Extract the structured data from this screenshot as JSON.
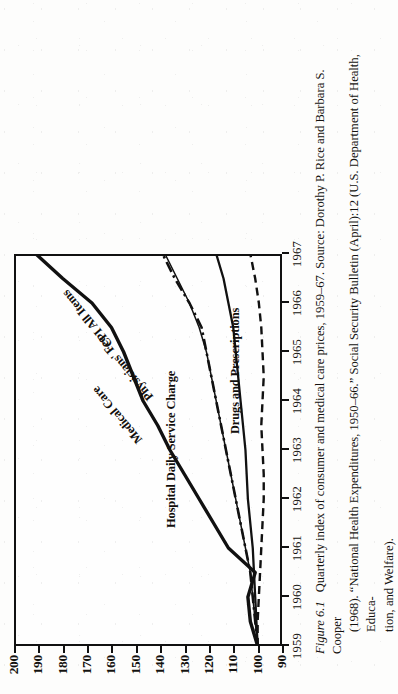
{
  "figure": {
    "number_label": "Figure 6.1",
    "caption_line1": "Quarterly index of consumer and medical care prices, 1959–67. Source: Dorothy P. Rice and Barbara S. Cooper",
    "caption_line2": "(1968). “National Health Expenditures, 1950–66.” Social Security Bulletin (April):12 (U.S. Department of Health, Educa-",
    "caption_line3": "tion, and Welfare).",
    "orientation": "rotated-90-ccw",
    "ink_color": "#111111",
    "paper_color": "#fdfdfc"
  },
  "axes": {
    "y_ticks": [
      "200",
      "190",
      "180",
      "170",
      "160",
      "150",
      "140",
      "130",
      "120",
      "110",
      "100",
      "90"
    ],
    "y_values": [
      200,
      190,
      180,
      170,
      160,
      150,
      140,
      130,
      120,
      110,
      100,
      90
    ],
    "y_min": 90,
    "y_max": 200,
    "x_ticks": [
      "1959",
      "1960",
      "1961",
      "1962",
      "1963",
      "1964",
      "1965",
      "1966",
      "1967"
    ],
    "x_values": [
      1959,
      1960,
      1961,
      1962,
      1963,
      1964,
      1965,
      1966,
      1967
    ],
    "x_min": 1959,
    "x_max": 1967,
    "grid": "off"
  },
  "series_labels": {
    "hospital": "Hospital Daily Service Charge",
    "medical_care": "Medical Care",
    "physicians_fee": "Physicians' Fee",
    "cpi": "CPI All Items",
    "drugs": "Drugs and Prescriptions"
  },
  "chart_data": {
    "type": "line",
    "title": "Quarterly index of consumer and medical care prices, 1959–67",
    "xlabel": "",
    "ylabel": "Index (1957–59 = 100)",
    "xlim": [
      1959,
      1967
    ],
    "ylim": [
      90,
      200
    ],
    "grid": false,
    "legend": "inline-labels",
    "x": [
      1959,
      1959.5,
      1960,
      1960.5,
      1961,
      1961.5,
      1962,
      1962.5,
      1963,
      1963.5,
      1964,
      1964.5,
      1965,
      1965.5,
      1966,
      1966.5,
      1967
    ],
    "series": [
      {
        "name": "Hospital Daily Service Charge",
        "style": "solid-thick",
        "values": [
          100,
          103,
          104,
          101,
          112,
          118,
          124,
          130,
          136,
          141,
          147,
          151,
          155,
          160,
          168,
          180,
          191
        ]
      },
      {
        "name": "Medical Care",
        "style": "solid-thin",
        "values": [
          100,
          101,
          102,
          103,
          105,
          107,
          109,
          111,
          113,
          115,
          117,
          119,
          121,
          124,
          128,
          133,
          138
        ]
      },
      {
        "name": "Physicians' Fee",
        "style": "dash-dot",
        "values": [
          100,
          101,
          102,
          103,
          105,
          107,
          109,
          111,
          113,
          115,
          117,
          119,
          121,
          123,
          128,
          134,
          139
        ]
      },
      {
        "name": "CPI All Items",
        "style": "solid-medium",
        "values": [
          100,
          100.5,
          101,
          101.5,
          102,
          103,
          104,
          104.5,
          105,
          106,
          107,
          108,
          109,
          110,
          112,
          114,
          117
        ]
      },
      {
        "name": "Drugs and Prescriptions",
        "style": "dashed",
        "values": [
          100,
          100,
          99.5,
          99,
          98.5,
          98,
          97.5,
          97.5,
          98,
          98.5,
          98,
          97.5,
          98,
          98.5,
          99.5,
          101,
          103
        ]
      }
    ]
  }
}
